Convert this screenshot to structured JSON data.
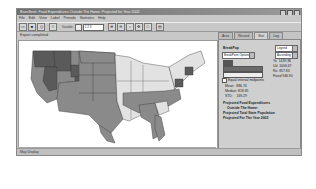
{
  "window": {
    "title": "BrainSeek: Food Expenditures Outside The Home: Projected for Year 2002"
  },
  "menu": [
    "File",
    "Edit",
    "View",
    "Label",
    "Periods",
    "Statistics",
    "Help"
  ],
  "toolbar": {
    "buttons": [
      "open-icon",
      "save-icon",
      "print-icon",
      "layers-icon",
      "zoom-in-icon",
      "zoom-out-icon",
      "zoom-select-icon",
      "pan-icon",
      "full-extent-icon",
      "info-icon"
    ],
    "field_label": "Variable:",
    "field_value": "1 2 3"
  },
  "status_top": "Export completed",
  "status_bar": "Map Display",
  "panel": {
    "tabs": [
      "Area",
      "Record",
      "Stat",
      "Log"
    ],
    "active_tab": "Stat",
    "heading": "BreakPop",
    "select_right_1": "Legend",
    "select_left": "BreakPoint Options",
    "select_right_2": "Ascending",
    "stats_right": [
      {
        "label": "Ye",
        "value": "1439.36"
      },
      {
        "label": "Ud",
        "value": "1006.67"
      },
      {
        "label": "Ro",
        "value": "857.83"
      },
      {
        "label": "Fixed",
        "value": "946.90"
      }
    ],
    "checkbox_label": "Equal interval midpoints",
    "stats": [
      {
        "label": "Mean:",
        "value": "886.74"
      },
      {
        "label": "Median:",
        "value": "818.85"
      },
      {
        "label": "STD:",
        "value": "169.29"
      }
    ],
    "description": [
      "Projected Food Expenditures",
      "Outside The Home:",
      "Projected Total State Population",
      "Projected For The Year 2002"
    ]
  },
  "colors": {
    "dark": "#5a5a5a",
    "mid": "#8a8a8a",
    "light": "#e2e2e2",
    "window": "#c8c8c8"
  }
}
